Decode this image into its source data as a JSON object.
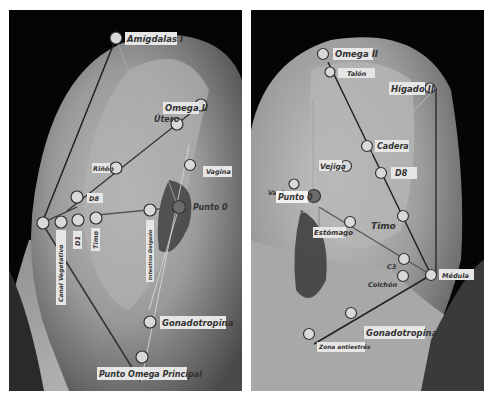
{
  "left_panel": {
    "labels": {
      "amigdalas": "Amígdalas I",
      "omega2": "Omega II",
      "utero": "Útero",
      "rinon": "Riñón",
      "vagina": "Vagina",
      "d8": "D8",
      "punto0": "Punto 0",
      "canal_vegetativo": "Canal Vegetativo",
      "d1": "D1",
      "timo": "Timo",
      "intestino_delgado": "Intestino Delgado",
      "gonadotropina": "Gonadotropina",
      "punto_omega_principal": "Punto Omega Principal"
    }
  },
  "right_panel": {
    "labels": {
      "omega2": "Omega II",
      "talon": "Talón",
      "higado2": "Hígado II",
      "cadera": "Cadera",
      "vejiga": "Vejiga",
      "d8": "D8",
      "vagina": "Vagina",
      "punto0": "Punto 0",
      "timo": "Timo",
      "estomago": "Estómago",
      "c3": "C3",
      "colchon": "Colchón",
      "medula": "Médula",
      "gonadotropina": "Gonadotropina",
      "zona_antiestres": "Zona antiestrés"
    }
  },
  "colors": {
    "point_fill": "#d9d9d9",
    "point_stroke": "#333333",
    "punto0_fill": "#6b6b6b",
    "label_bg": "#e6e6e6",
    "line_dark": "#222222",
    "line_light": "#bbbbbb"
  }
}
